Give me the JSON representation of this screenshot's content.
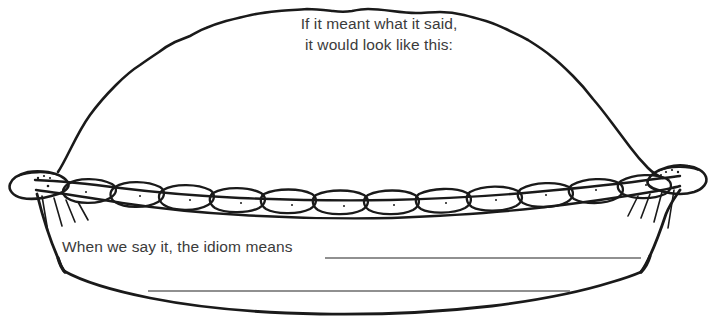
{
  "worksheet": {
    "title": "Idiom Pie Worksheet",
    "background_color": "#ffffff",
    "ink_color": "#1a1a1a",
    "text_color": "#3b3b3b",
    "rule_line_color": "#6b6b6b"
  },
  "prompts": {
    "top_line_1": "If it meant what it said,",
    "top_line_2": "it would look like this:",
    "top_full": "If it meant what it said,\nit would look like this:",
    "bottom": "When we say it, the idiom means"
  },
  "answer_lines": [
    {
      "index": 1,
      "x1": 325,
      "x2": 641,
      "y": 258
    },
    {
      "index": 2,
      "x1": 148,
      "x2": 570,
      "y": 291
    }
  ],
  "illustration": {
    "name": "pie-drawing",
    "description": "Hand-drawn line art of a whole pie with a domed top crust, braided fluted rim and a pie dish",
    "parts": [
      "dome-crust",
      "braided-rim",
      "pie-dish",
      "left-rim-tip",
      "right-rim-tip",
      "hatching-left",
      "hatching-right"
    ],
    "braid_segment_count": 12
  }
}
